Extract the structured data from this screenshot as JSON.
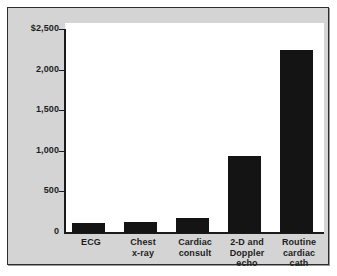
{
  "chart_data": {
    "type": "bar",
    "title": "",
    "xlabel": "",
    "ylabel": "",
    "categories": [
      "ECG",
      "Chest x-ray",
      "Cardiac consult",
      "2-D and Doppler echo",
      "Routine cardiac cath"
    ],
    "category_lines": [
      [
        "ECG"
      ],
      [
        "Chest",
        "x-ray"
      ],
      [
        "Cardiac",
        "consult"
      ],
      [
        "2-D and",
        "Doppler",
        "echo"
      ],
      [
        "Routine",
        "cardiac",
        "cath"
      ]
    ],
    "values": [
      120,
      130,
      190,
      940,
      2240
    ],
    "ylim": [
      0,
      2500
    ],
    "ytick_values": [
      0,
      500,
      1000,
      1500,
      2000,
      2500
    ],
    "ytick_labels": [
      "0",
      "500",
      "1,000",
      "1,500",
      "2,000",
      "$2,500"
    ],
    "grid": false,
    "legend": null,
    "bar_color": "#141414",
    "plot_background": "#ffffff",
    "figure_background": "#d4d4d4",
    "axis_color": "#1a1a1a"
  }
}
